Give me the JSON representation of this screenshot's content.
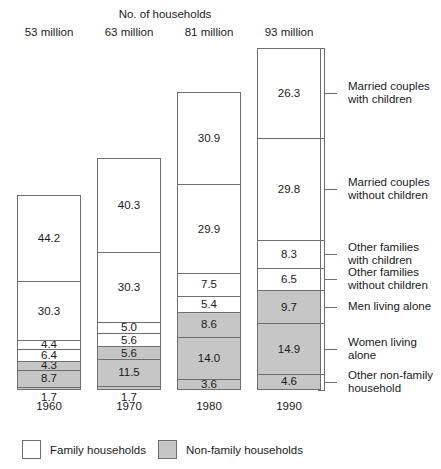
{
  "chart_data": {
    "type": "bar",
    "subtype": "stacked-bar-100-percent",
    "title": "No. of households",
    "xlabel": "",
    "ylabel": "",
    "grid": false,
    "legend_position": "bottom",
    "categories": [
      "1960",
      "1970",
      "1980",
      "1990"
    ],
    "column_headers": [
      "53 million",
      "63 million",
      "81 million",
      "93 million"
    ],
    "totals_millions": [
      53,
      63,
      81,
      93
    ],
    "series": [
      {
        "name": "Married couples with children",
        "group": "Family households",
        "values": [
          44.2,
          40.3,
          30.9,
          26.3
        ]
      },
      {
        "name": "Married couples without children",
        "group": "Family households",
        "values": [
          30.3,
          30.3,
          29.9,
          29.8
        ]
      },
      {
        "name": "Other families with children",
        "group": "Family households",
        "values": [
          4.4,
          5.0,
          7.5,
          8.3
        ]
      },
      {
        "name": "Other families without children",
        "group": "Family households",
        "values": [
          6.4,
          5.6,
          5.4,
          6.5
        ]
      },
      {
        "name": "Men living alone",
        "group": "Non-family households",
        "values": [
          4.3,
          5.6,
          8.6,
          9.7
        ]
      },
      {
        "name": "Women living alone",
        "group": "Non-family households",
        "values": [
          8.7,
          11.5,
          14.0,
          14.9
        ]
      },
      {
        "name": "Other non-family household",
        "group": "Non-family households",
        "values": [
          1.7,
          1.7,
          3.6,
          4.6
        ]
      }
    ],
    "legend": [
      {
        "label": "Family households",
        "swatch": "white"
      },
      {
        "label": "Non-family households",
        "swatch": "gray"
      }
    ],
    "colors": {
      "family": "#ffffff",
      "nonfamily": "#c6c6c6",
      "outline": "#6e6e6e",
      "text": "#1a1a1a"
    }
  },
  "bars": [
    {
      "header": "53 million",
      "year": "1960",
      "below_value": "1.7",
      "segments": [
        {
          "value": "44.2",
          "group": "family",
          "show_label": true
        },
        {
          "value": "30.3",
          "group": "family",
          "show_label": true
        },
        {
          "value": "4.4",
          "group": "family",
          "show_label": true
        },
        {
          "value": "6.4",
          "group": "family",
          "show_label": true
        },
        {
          "value": "4.3",
          "group": "nonfamily",
          "show_label": true
        },
        {
          "value": "8.7",
          "group": "nonfamily",
          "show_label": true
        },
        {
          "value": "1.7",
          "group": "nonfamily",
          "show_label": false
        }
      ]
    },
    {
      "header": "63 million",
      "year": "1970",
      "below_value": "1.7",
      "segments": [
        {
          "value": "40.3",
          "group": "family",
          "show_label": true
        },
        {
          "value": "30.3",
          "group": "family",
          "show_label": true
        },
        {
          "value": "5.0",
          "group": "family",
          "show_label": true
        },
        {
          "value": "5.6",
          "group": "family",
          "show_label": true
        },
        {
          "value": "5.6",
          "group": "nonfamily",
          "show_label": true
        },
        {
          "value": "11.5",
          "group": "nonfamily",
          "show_label": true
        },
        {
          "value": "1.7",
          "group": "nonfamily",
          "show_label": false
        }
      ]
    },
    {
      "header": "81 million",
      "year": "1980",
      "below_value": "",
      "segments": [
        {
          "value": "30.9",
          "group": "family",
          "show_label": true
        },
        {
          "value": "29.9",
          "group": "family",
          "show_label": true
        },
        {
          "value": "7.5",
          "group": "family",
          "show_label": true
        },
        {
          "value": "5.4",
          "group": "family",
          "show_label": true
        },
        {
          "value": "8.6",
          "group": "nonfamily",
          "show_label": true
        },
        {
          "value": "14.0",
          "group": "nonfamily",
          "show_label": true
        },
        {
          "value": "3.6",
          "group": "nonfamily",
          "show_label": true
        }
      ]
    },
    {
      "header": "93 million",
      "year": "1990",
      "below_value": "",
      "segments": [
        {
          "value": "26.3",
          "group": "family",
          "show_label": true
        },
        {
          "value": "29.8",
          "group": "family",
          "show_label": true
        },
        {
          "value": "8.3",
          "group": "family",
          "show_label": true
        },
        {
          "value": "6.5",
          "group": "family",
          "show_label": true
        },
        {
          "value": "9.7",
          "group": "nonfamily",
          "show_label": true
        },
        {
          "value": "14.9",
          "group": "nonfamily",
          "show_label": true
        },
        {
          "value": "4.6",
          "group": "nonfamily",
          "show_label": true
        }
      ]
    }
  ],
  "callouts": [
    {
      "label": "Married couples with children"
    },
    {
      "label": "Married couples without children"
    },
    {
      "label": "Other families with children"
    },
    {
      "label": "Other families without children"
    },
    {
      "label": "Men living alone"
    },
    {
      "label": "Women living alone"
    },
    {
      "label": "Other non-family household"
    }
  ],
  "legend": {
    "family_label": "Family households",
    "nonfamily_label": "Non-family households"
  }
}
